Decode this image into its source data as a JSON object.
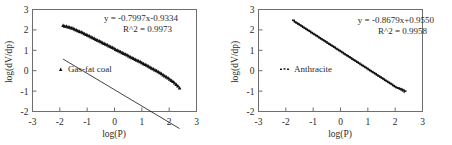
{
  "figure": {
    "panel_count": 2
  },
  "chart_data": [
    {
      "id": "gas-fat-coal",
      "type": "scatter",
      "title": "",
      "xlabel": "log(P)",
      "ylabel": "log(dV/dp)",
      "xlim": [
        -3,
        3
      ],
      "ylim": [
        -2,
        3
      ],
      "xticks": [
        "-3",
        "-2",
        "-1",
        "0",
        "1",
        "2",
        "3"
      ],
      "yticks": [
        "3",
        "2",
        "1",
        "0",
        "-1",
        "-2"
      ],
      "xtick_values": [
        -3,
        -2,
        -1,
        0,
        1,
        2,
        3
      ],
      "ytick_values": [
        3,
        2,
        1,
        0,
        -1,
        -2
      ],
      "grid": false,
      "legend": [
        {
          "label": "Gas-fat coal",
          "marker": "triangle",
          "color": "#111111"
        }
      ],
      "legend_position": "center-left",
      "annotations": [
        {
          "name": "regression-equation",
          "text": "y = -0.7997x-0.9334"
        },
        {
          "name": "r-squared",
          "text": "R^2 = 0.9973"
        }
      ],
      "fit": {
        "slope": -0.7997,
        "intercept": -0.9334,
        "r2": 0.9973
      },
      "x": [
        -1.88,
        -1.82,
        -1.76,
        -1.7,
        -1.64,
        -1.58,
        -1.52,
        -1.46,
        -1.4,
        -1.34,
        -1.28,
        -1.22,
        -1.16,
        -1.1,
        -1.04,
        -0.98,
        -0.92,
        -0.86,
        -0.8,
        -0.74,
        -0.68,
        -0.62,
        -0.56,
        -0.5,
        -0.44,
        -0.38,
        -0.32,
        -0.26,
        -0.2,
        -0.14,
        -0.08,
        -0.02,
        0.04,
        0.1,
        0.16,
        0.22,
        0.28,
        0.34,
        0.4,
        0.46,
        0.52,
        0.58,
        0.64,
        0.7,
        0.76,
        0.82,
        0.88,
        0.94,
        1.0,
        1.06,
        1.12,
        1.18,
        1.24,
        1.3,
        1.36,
        1.42,
        1.48,
        1.54,
        1.6,
        1.66,
        1.72,
        1.78,
        1.84,
        1.9,
        1.96,
        2.02,
        2.08,
        2.14,
        2.2,
        2.26,
        2.32,
        2.38
      ],
      "y": [
        2.22,
        2.18,
        2.18,
        2.15,
        2.13,
        2.1,
        2.08,
        2.04,
        2.0,
        1.96,
        1.93,
        1.9,
        1.86,
        1.82,
        1.78,
        1.74,
        1.7,
        1.66,
        1.62,
        1.58,
        1.54,
        1.5,
        1.46,
        1.42,
        1.38,
        1.34,
        1.3,
        1.26,
        1.22,
        1.18,
        1.14,
        1.1,
        1.05,
        1.01,
        0.97,
        0.93,
        0.89,
        0.85,
        0.81,
        0.77,
        0.72,
        0.68,
        0.64,
        0.6,
        0.56,
        0.52,
        0.48,
        0.44,
        0.4,
        0.35,
        0.31,
        0.27,
        0.22,
        0.18,
        0.13,
        0.09,
        0.04,
        0.0,
        -0.05,
        -0.1,
        -0.15,
        -0.2,
        -0.25,
        -0.3,
        -0.35,
        -0.41,
        -0.47,
        -0.53,
        -0.6,
        -0.67,
        -0.75,
        -0.84
      ]
    },
    {
      "id": "anthracite",
      "type": "scatter",
      "title": "",
      "xlabel": "log(P)",
      "ylabel": "log(dV/dp)",
      "xlim": [
        -3,
        3
      ],
      "ylim": [
        -2,
        3
      ],
      "xticks": [
        "-3",
        "-2",
        "-1",
        "0",
        "1",
        "2",
        "3"
      ],
      "yticks": [
        "3",
        "2",
        "1",
        "0",
        "-1",
        "-2"
      ],
      "xtick_values": [
        -3,
        -2,
        -1,
        0,
        1,
        2,
        3
      ],
      "ytick_values": [
        3,
        2,
        1,
        0,
        -1,
        -2
      ],
      "grid": false,
      "legend": [
        {
          "label": "Anthracite",
          "marker": "dash-dots",
          "color": "#111111"
        }
      ],
      "legend_position": "center-left",
      "annotations": [
        {
          "name": "regression-equation",
          "text": "y = -0.8679x+0.9550"
        },
        {
          "name": "r-squared",
          "text": "R^2 = 0.9958"
        }
      ],
      "fit": {
        "slope": -0.8679,
        "intercept": 0.955,
        "r2": 0.9958
      },
      "x": [
        -1.72,
        -1.66,
        -1.6,
        -1.54,
        -1.48,
        -1.42,
        -1.36,
        -1.3,
        -1.24,
        -1.18,
        -1.12,
        -1.06,
        -1.0,
        -0.94,
        -0.88,
        -0.82,
        -0.76,
        -0.7,
        -0.64,
        -0.58,
        -0.52,
        -0.46,
        -0.4,
        -0.34,
        -0.28,
        -0.22,
        -0.16,
        -0.1,
        -0.04,
        0.02,
        0.08,
        0.14,
        0.2,
        0.26,
        0.32,
        0.38,
        0.44,
        0.5,
        0.56,
        0.62,
        0.68,
        0.74,
        0.8,
        0.86,
        0.92,
        0.98,
        1.04,
        1.1,
        1.16,
        1.22,
        1.28,
        1.34,
        1.4,
        1.46,
        1.52,
        1.58,
        1.64,
        1.7,
        1.76,
        1.82,
        1.88,
        1.94,
        2.0,
        2.06,
        2.12,
        2.18,
        2.24,
        2.3,
        2.36
      ],
      "y": [
        2.47,
        2.39,
        2.34,
        2.29,
        2.24,
        2.19,
        2.13,
        2.08,
        2.03,
        1.98,
        1.93,
        1.87,
        1.82,
        1.77,
        1.72,
        1.67,
        1.61,
        1.56,
        1.51,
        1.46,
        1.41,
        1.35,
        1.3,
        1.25,
        1.2,
        1.15,
        1.09,
        1.04,
        0.99,
        0.94,
        0.89,
        0.83,
        0.78,
        0.73,
        0.68,
        0.63,
        0.57,
        0.52,
        0.47,
        0.42,
        0.37,
        0.31,
        0.26,
        0.21,
        0.16,
        0.11,
        0.05,
        0.0,
        -0.05,
        -0.1,
        -0.15,
        -0.21,
        -0.26,
        -0.31,
        -0.36,
        -0.41,
        -0.47,
        -0.52,
        -0.57,
        -0.62,
        -0.67,
        -0.73,
        -0.78,
        -0.83,
        -0.85,
        -0.88,
        -0.91,
        -0.95,
        -1.0
      ]
    }
  ]
}
